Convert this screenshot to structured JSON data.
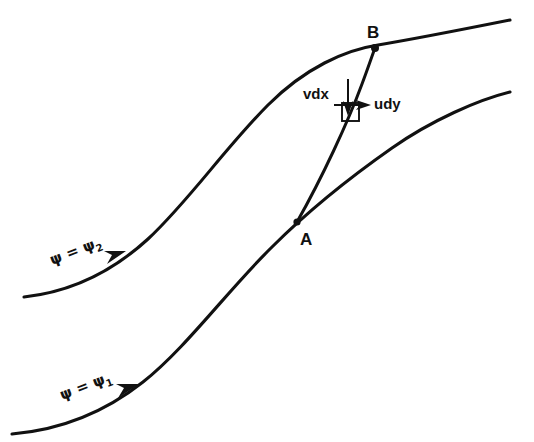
{
  "figure": {
    "name": "streamline-flow-diagram",
    "background_color": "#ffffff",
    "ink_color": "#111111",
    "width": 534,
    "height": 442
  },
  "points": {
    "a": {
      "label": "A",
      "x": 297,
      "y": 222
    },
    "b": {
      "label": "B",
      "x": 375,
      "y": 48
    }
  },
  "vectors": {
    "vdx": {
      "label": "vdx",
      "direction": "down"
    },
    "udy": {
      "label": "udy",
      "direction": "right"
    }
  },
  "streamlines": [
    {
      "id": "upper",
      "label_prefix": "ψ = ψ",
      "label_sub": "2",
      "label_full": "ψ = ψ₂",
      "arrow_direction": "up-right"
    },
    {
      "id": "lower",
      "label_prefix": "ψ = ψ",
      "label_sub": "1",
      "label_full": "ψ = ψ₁",
      "arrow_direction": "up-right"
    }
  ],
  "element": {
    "name": "fluid-element-square"
  }
}
